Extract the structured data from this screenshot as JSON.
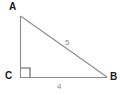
{
  "figure": {
    "type": "right-triangle-diagram",
    "background_color": "#ffffff",
    "stroke_color": "#8c8c8c",
    "vertex_label_color": "#1a1a1a",
    "side_label_color": "#8c8c8c",
    "width": 120,
    "height": 95
  },
  "vertices": {
    "a": {
      "label": "A",
      "x": 20,
      "y": 16
    },
    "b": {
      "label": "B",
      "x": 107,
      "y": 77
    },
    "c": {
      "label": "C",
      "x": 20,
      "y": 77
    }
  },
  "sides": {
    "hypotenuse": {
      "label": "5",
      "from": "A",
      "to": "B"
    },
    "base": {
      "label": "4",
      "from": "C",
      "to": "B"
    },
    "vertical": {
      "label": "",
      "from": "A",
      "to": "C"
    }
  },
  "markers": {
    "right_angle": {
      "at": "C",
      "size": 9
    }
  }
}
